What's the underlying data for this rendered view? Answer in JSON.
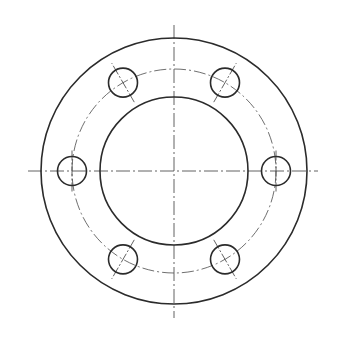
{
  "drawing": {
    "title": "Flange front view",
    "canvas": {
      "width": 337,
      "height": 344
    },
    "colors": {
      "line": "#2b2b2b",
      "centerline": "#3a3a3a",
      "background": "#ffffff"
    },
    "center": {
      "x": 174,
      "y": 171
    },
    "outer_circle": {
      "r": 133
    },
    "bore_circle": {
      "r": 74
    },
    "bolt_circle": {
      "r": 102
    },
    "bolt_holes": {
      "count": 6,
      "r": 14.5,
      "angles_deg": [
        0,
        60,
        120,
        180,
        240,
        300
      ]
    },
    "centerlines": {
      "horizontal": {
        "x1": 28,
        "x2": 318
      },
      "vertical": {
        "y1": 25,
        "y2": 318
      }
    }
  }
}
